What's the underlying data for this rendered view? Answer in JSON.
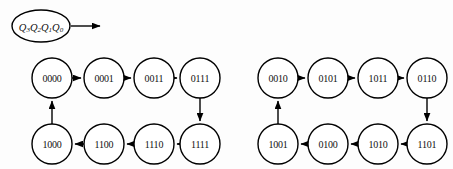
{
  "figure": {
    "background_color": "#fdfdfd",
    "stroke_color": "#000000",
    "node_fill": "#ffffff"
  },
  "seed": {
    "name": "register-state-label",
    "text": "Q3Q2Q1Q0",
    "letter": "Q",
    "subscripts": [
      "3",
      "2",
      "1",
      "0"
    ],
    "shape": "ellipse",
    "arrow_label": ""
  },
  "graphs": [
    {
      "id": "left-cycle",
      "name": "left-state-cycle",
      "top_row": [
        "0000",
        "0001",
        "0011",
        "0111"
      ],
      "bottom_row": [
        "1000",
        "1100",
        "1110",
        "1111"
      ],
      "top_direction": "left-to-right",
      "bottom_direction": "right-to-left",
      "right_link_direction": "down",
      "left_link_direction": "up"
    },
    {
      "id": "right-cycle",
      "name": "right-state-cycle",
      "top_row": [
        "0010",
        "0101",
        "1011",
        "0110"
      ],
      "bottom_row": [
        "1001",
        "0100",
        "1010",
        "1101"
      ],
      "top_direction": "left-to-right",
      "bottom_direction": "right-to-left",
      "right_link_direction": "down",
      "left_link_direction": "up"
    }
  ],
  "layout": {
    "node_radius": 20,
    "top_row_y": 78,
    "bottom_row_y": 144,
    "left_cycle_x": [
      52,
      104,
      154,
      200
    ],
    "right_cycle_x": [
      278,
      328,
      378,
      427
    ],
    "seed_ellipse": {
      "cx": 41,
      "cy": 26,
      "rx": 29,
      "ry": 16
    },
    "seed_arrow": {
      "x1": 71,
      "x2": 103,
      "y": 26
    }
  }
}
